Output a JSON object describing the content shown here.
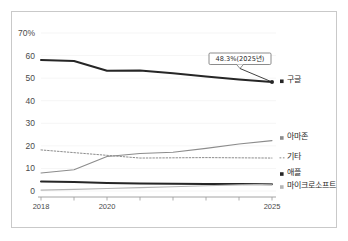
{
  "chart_data": {
    "type": "line",
    "title": "",
    "xlabel": "",
    "ylabel": "",
    "x": [
      2018,
      2019,
      2020,
      2021,
      2022,
      2023,
      2024,
      2025
    ],
    "xticks": [
      2018,
      2019,
      2020,
      2021,
      2022,
      2023,
      2024,
      2025
    ],
    "xtick_labels": [
      "2018",
      "",
      "2020",
      "",
      "",
      "",
      "",
      "2025"
    ],
    "xlim": [
      2018,
      2025
    ],
    "ylim": [
      0,
      70
    ],
    "yticks": [
      0,
      10,
      20,
      30,
      40,
      50,
      60,
      70
    ],
    "ytick_labels": [
      "0",
      "10",
      "20",
      "30",
      "40",
      "50",
      "60",
      "70%"
    ],
    "grid": true,
    "legend_position": "right",
    "series": [
      {
        "name": "구글",
        "style": "solid",
        "color": "#262626",
        "width": 2.0,
        "values": [
          58.0,
          57.6,
          53.3,
          53.4,
          52.2,
          50.7,
          49.4,
          48.3
        ],
        "end_marker": true
      },
      {
        "name": "아마존",
        "style": "solid",
        "color": "#8c8c8c",
        "width": 1.1,
        "values": [
          8.0,
          9.4,
          15.3,
          16.6,
          17.2,
          18.9,
          20.8,
          22.3
        ],
        "end_marker": false
      },
      {
        "name": "기타",
        "style": "dotted",
        "color": "#8c8c8c",
        "width": 1.0,
        "values": [
          18.2,
          17.0,
          15.8,
          14.6,
          14.7,
          14.8,
          14.7,
          14.6
        ],
        "end_marker": false
      },
      {
        "name": "애플",
        "style": "solid",
        "color": "#262626",
        "width": 2.0,
        "values": [
          4.2,
          4.0,
          3.5,
          3.3,
          3.2,
          3.1,
          3.1,
          3.0
        ],
        "end_marker": false
      },
      {
        "name": "마이크로소프트",
        "style": "solid",
        "color": "#b5b5b5",
        "width": 1.1,
        "values": [
          0.4,
          0.7,
          1.1,
          1.5,
          1.9,
          2.3,
          2.7,
          3.0
        ],
        "end_marker": false
      }
    ],
    "annotations": [
      {
        "text": "48.3%(2025년)",
        "x": 2025,
        "y": 48.3,
        "marker": "dot"
      }
    ]
  },
  "legend": {
    "items": [
      {
        "label": "구글",
        "marker": "square"
      },
      {
        "label": "아마존",
        "marker": "square"
      },
      {
        "label": "기타",
        "marker": "dashes"
      },
      {
        "label": "애플",
        "marker": "square"
      },
      {
        "label": "마이크로소프트",
        "marker": "square"
      }
    ]
  },
  "colors": {
    "frame_border": "#c9c9c9",
    "axis": "#9a9a9a",
    "grid": "#f0f0f0",
    "dark_series": "#262626",
    "mid_series": "#8c8c8c",
    "light_series": "#b5b5b5",
    "background": "#ffffff"
  }
}
